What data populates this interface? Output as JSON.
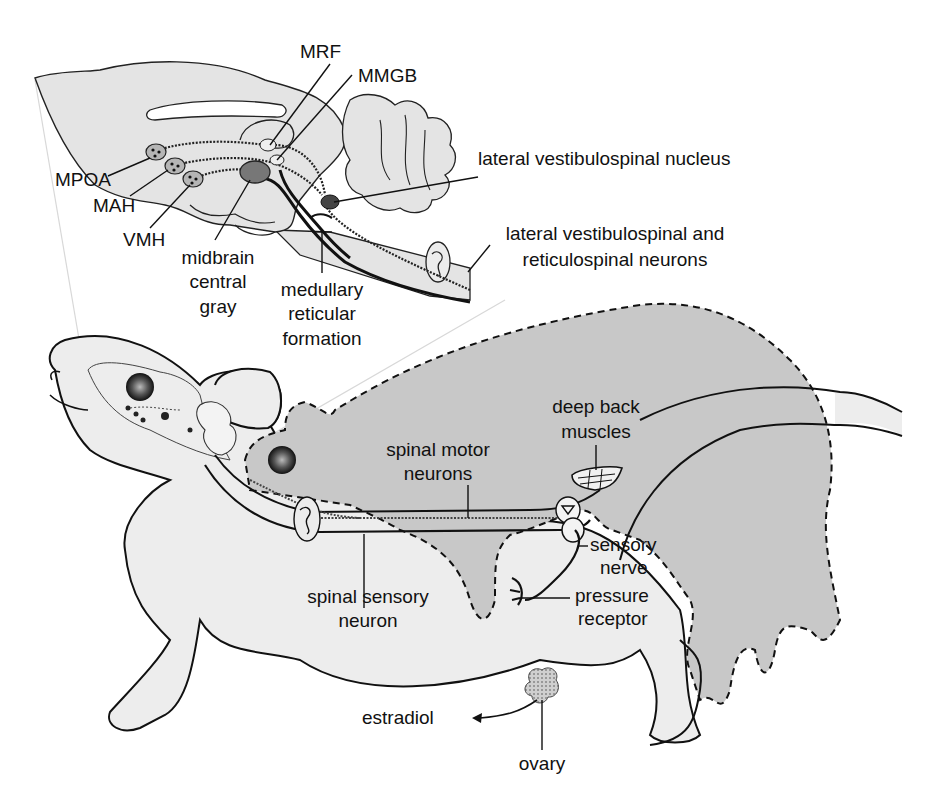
{
  "diagram": {
    "colors": {
      "background": "#ffffff",
      "rat_fill_light": "#ededed",
      "rat_fill_dark": "#c8c8c8",
      "brain_fill": "#e4e4e4",
      "outline": "#111111",
      "nucleus_fill": "#9a9a9a",
      "nucleus_dark": "#555555"
    },
    "brain_inset_labels": {
      "mrf": "MRF",
      "mmgb": "MMGB",
      "mpoa": "MPOA",
      "mah": "MAH",
      "vmh": "VMH",
      "midbrain_central_gray_line1": "midbrain",
      "midbrain_central_gray_line2": "central",
      "midbrain_central_gray_line3": "gray",
      "medullary_reticular_formation_line1": "medullary",
      "medullary_reticular_formation_line2": "reticular",
      "medullary_reticular_formation_line3": "formation",
      "lateral_vestibulospinal_nucleus": "lateral vestibulospinal nucleus",
      "lateral_vestibulospinal_reticulospinal_line1": "lateral vestibulospinal and",
      "lateral_vestibulospinal_reticulospinal_line2": "reticulospinal neurons"
    },
    "body_labels": {
      "deep_back_muscles_line1": "deep back",
      "deep_back_muscles_line2": "muscles",
      "spinal_motor_neurons_line1": "spinal motor",
      "spinal_motor_neurons_line2": "neurons",
      "sensory_nerve_line1": "sensory",
      "sensory_nerve_line2": "nerve",
      "pressure_receptor_line1": "pressure",
      "pressure_receptor_line2": "receptor",
      "spinal_sensory_neuron_line1": "spinal sensory",
      "spinal_sensory_neuron_line2": "neuron",
      "estradiol": "estradiol",
      "ovary": "ovary"
    }
  }
}
